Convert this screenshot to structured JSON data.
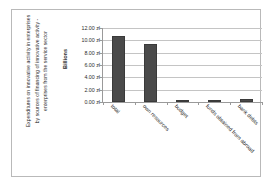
{
  "chart_data": {
    "type": "bar",
    "title": "Expenditures on innovative activity in enterprises by sources of financing of innovative activity - enterprises from the service sector",
    "xlabel": "",
    "ylabel": "Billions",
    "categories": [
      "total",
      "own resources",
      "budget",
      "funds obtained from abroad",
      "bank debts"
    ],
    "values": [
      10.7,
      9.4,
      0.2,
      0.25,
      0.45
    ],
    "ylim": [
      0,
      12
    ],
    "ytick_values": [
      0,
      2,
      4,
      6,
      8,
      10,
      12
    ],
    "ytick_labels": [
      "0.00 zł",
      "2.00 zł",
      "4.00 zł",
      "6.00 zł",
      "8.00 zł",
      "10.00 zł",
      "12.00 zł"
    ],
    "currency": "zł",
    "unit_multiplier": "Billions",
    "grid": true,
    "legend": false,
    "bar_color": "#4a4a4a",
    "gridline_color": "#c4c4c4",
    "axis_color": "#9a9a9a",
    "frame_color": "#b9b9b9",
    "text_color": "#2b2b2b",
    "xlabel_rotation": 45
  }
}
